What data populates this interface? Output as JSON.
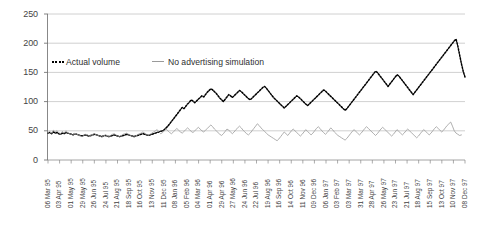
{
  "chart_data": {
    "type": "line",
    "title": "",
    "xlabel": "",
    "ylabel": "",
    "ylim": [
      0,
      250
    ],
    "yticks": [
      0,
      50,
      100,
      150,
      200,
      250
    ],
    "grid": true,
    "legend_position": "inside-top-left",
    "xtick_labels": [
      "06 Mar 95",
      "03 Apr 95",
      "01 May 95",
      "29 May 95",
      "26 Jun 95",
      "24 Jul 95",
      "21 Aug 95",
      "18 Sep 95",
      "16 Oct 95",
      "13 Nov 95",
      "11 Dec 95",
      "08 Jan 96",
      "05 Feb 96",
      "04 Mar 96",
      "01 Apr 96",
      "29 Apr 96",
      "27 May 96",
      "24 Jun 96",
      "22 Jul 96",
      "19 Aug 96",
      "16 Sep 96",
      "14 Oct 96",
      "11 Nov 96",
      "09 Dec 96",
      "06 Jan 97",
      "03 Feb 97",
      "03 Mar 97",
      "31 Mar 97",
      "28 Apr 97",
      "26 May 97",
      "23 Jun 97",
      "21 Jul 97",
      "18 Aug 97",
      "15 Sep 97",
      "13 Oct 97",
      "10 Nov 97",
      "08 Dec 97"
    ],
    "series": [
      {
        "name": "Actual volume",
        "style": "dotted",
        "color": "#000000",
        "values": [
          46,
          47,
          45,
          48,
          46,
          47,
          45,
          44,
          46,
          45,
          47,
          46,
          45,
          44,
          43,
          45,
          44,
          43,
          42,
          41,
          42,
          43,
          42,
          41,
          42,
          43,
          44,
          43,
          42,
          41,
          40,
          41,
          42,
          41,
          40,
          41,
          42,
          43,
          42,
          41,
          40,
          41,
          42,
          43,
          44,
          43,
          42,
          41,
          40,
          41,
          42,
          43,
          44,
          45,
          44,
          43,
          42,
          43,
          44,
          45,
          46,
          47,
          48,
          49,
          50,
          52,
          55,
          58,
          62,
          66,
          70,
          74,
          78,
          82,
          86,
          90,
          88,
          92,
          96,
          99,
          103,
          101,
          98,
          101,
          104,
          107,
          110,
          108,
          112,
          116,
          119,
          122,
          120,
          117,
          114,
          110,
          106,
          103,
          100,
          104,
          108,
          112,
          110,
          107,
          110,
          113,
          116,
          119,
          117,
          114,
          111,
          108,
          105,
          103,
          106,
          109,
          112,
          115,
          118,
          121,
          124,
          126,
          123,
          119,
          115,
          111,
          107,
          104,
          101,
          98,
          95,
          92,
          89,
          92,
          95,
          98,
          101,
          104,
          107,
          110,
          108,
          105,
          102,
          99,
          96,
          93,
          96,
          99,
          102,
          105,
          108,
          111,
          114,
          117,
          120,
          118,
          115,
          112,
          109,
          106,
          103,
          100,
          97,
          94,
          91,
          88,
          85,
          88,
          92,
          96,
          100,
          104,
          108,
          112,
          116,
          120,
          124,
          128,
          132,
          136,
          140,
          144,
          148,
          152,
          150,
          146,
          142,
          138,
          134,
          130,
          126,
          130,
          134,
          138,
          142,
          146,
          144,
          140,
          136,
          132,
          128,
          124,
          120,
          116,
          112,
          116,
          120,
          124,
          128,
          132,
          136,
          140,
          144,
          148,
          152,
          156,
          160,
          164,
          168,
          172,
          176,
          180,
          184,
          188,
          192,
          196,
          200,
          204,
          207,
          195,
          180,
          165,
          152,
          142
        ]
      },
      {
        "name": "No advertising simulation",
        "style": "solid",
        "color": "#9a9a9a",
        "values": [
          47,
          49,
          46,
          51,
          48,
          50,
          47,
          45,
          49,
          46,
          50,
          47,
          45,
          44,
          42,
          46,
          44,
          43,
          41,
          40,
          42,
          44,
          43,
          41,
          42,
          44,
          45,
          43,
          42,
          41,
          39,
          41,
          43,
          42,
          40,
          42,
          44,
          45,
          43,
          41,
          40,
          42,
          44,
          45,
          46,
          44,
          42,
          41,
          39,
          41,
          43,
          45,
          46,
          48,
          46,
          44,
          42,
          44,
          46,
          48,
          50,
          52,
          48,
          45,
          47,
          50,
          53,
          50,
          47,
          45,
          48,
          51,
          54,
          51,
          48,
          46,
          49,
          52,
          55,
          52,
          49,
          47,
          50,
          53,
          56,
          53,
          50,
          48,
          51,
          54,
          57,
          60,
          57,
          53,
          50,
          47,
          44,
          42,
          45,
          49,
          53,
          51,
          48,
          45,
          48,
          52,
          55,
          58,
          55,
          51,
          48,
          45,
          43,
          46,
          50,
          54,
          58,
          62,
          59,
          55,
          52,
          49,
          46,
          43,
          41,
          39,
          37,
          35,
          33,
          36,
          40,
          44,
          48,
          45,
          42,
          46,
          50,
          53,
          50,
          47,
          44,
          41,
          44,
          48,
          52,
          49,
          46,
          43,
          46,
          50,
          54,
          57,
          54,
          50,
          47,
          44,
          47,
          51,
          55,
          52,
          48,
          45,
          42,
          40,
          38,
          36,
          34,
          37,
          41,
          45,
          49,
          52,
          49,
          46,
          43,
          46,
          50,
          54,
          57,
          54,
          51,
          48,
          45,
          42,
          45,
          49,
          53,
          56,
          53,
          50,
          47,
          44,
          41,
          44,
          48,
          52,
          49,
          46,
          43,
          46,
          50,
          53,
          50,
          47,
          44,
          41,
          38,
          41,
          45,
          49,
          52,
          49,
          46,
          43,
          46,
          50,
          54,
          57,
          54,
          51,
          48,
          51,
          55,
          59,
          62,
          65,
          58,
          50,
          46,
          44,
          42,
          43
        ]
      }
    ]
  },
  "axis": {
    "y_tick_labels": [
      "250",
      "200",
      "150",
      "100",
      "50",
      "0"
    ]
  },
  "legend": {
    "items": [
      {
        "label": "Actual volume",
        "marker": "dotted-line",
        "color": "#000000"
      },
      {
        "label": "No advertising simulation",
        "marker": "solid-line",
        "color": "#9a9a9a"
      }
    ]
  }
}
